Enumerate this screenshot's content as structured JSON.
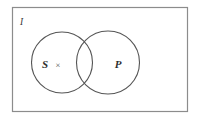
{
  "figure": {
    "name": "euler-venn-diagram",
    "background_color": "#ffffff",
    "stroke_color": "#555555",
    "label_color": "#2e2e2e"
  },
  "universe": {
    "label": "I",
    "label_x": 20,
    "label_y": 25,
    "rect": {
      "x": 12,
      "y": 7,
      "width": 176,
      "height": 105
    },
    "border_color": "#8c8c8c"
  },
  "circles": [
    {
      "label": "S",
      "name": "circle-s",
      "cx": 62,
      "cy": 62.5,
      "r": 30.5,
      "label_x": 45,
      "label_y": 68,
      "stroke": "#555555"
    },
    {
      "label": "P",
      "name": "circle-p",
      "cx": 108,
      "cy": 62.5,
      "r": 31.5,
      "label_x": 118,
      "label_y": 68,
      "stroke": "#555555"
    }
  ],
  "marks": [
    {
      "symbol": "×",
      "name": "member-cross-mark",
      "x": 58,
      "y": 68,
      "region": "S-only"
    }
  ],
  "font_sizes": {
    "set_label": "11",
    "universe_label": "9",
    "mark": "8"
  }
}
